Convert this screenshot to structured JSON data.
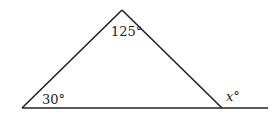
{
  "diagram": {
    "type": "triangle-exterior-angle",
    "angles": {
      "apex": "125°",
      "bottom_left": "30°",
      "exterior_right": "x°"
    },
    "exterior_variable": "x",
    "degree_symbol": "°",
    "colors": {
      "stroke": "#222222",
      "background": "#ffffff"
    }
  }
}
